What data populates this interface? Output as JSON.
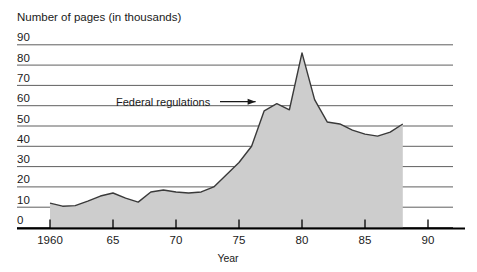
{
  "chart_data": {
    "type": "area",
    "title": "Number of pages (in thousands)",
    "xlabel": "Year",
    "ylabel": "",
    "ylim": [
      0,
      90
    ],
    "xlim": [
      1960,
      1990
    ],
    "grid": true,
    "legend": "none",
    "series_name": "Federal regulations",
    "annotations": [
      {
        "text": "Federal regulations",
        "points_to_x": 1976,
        "points_to_y": 62
      }
    ],
    "y_ticks": [
      "0",
      "10",
      "20",
      "30",
      "40",
      "50",
      "60",
      "70",
      "80",
      "90"
    ],
    "y_tick_values": [
      0,
      10,
      20,
      30,
      40,
      50,
      60,
      70,
      80,
      90
    ],
    "x_ticks": [
      "1960",
      "65",
      "70",
      "75",
      "80",
      "85",
      "90"
    ],
    "x_tick_values": [
      1960,
      1965,
      1970,
      1975,
      1980,
      1985,
      1990
    ],
    "x": [
      1960,
      1961,
      1962,
      1963,
      1964,
      1965,
      1966,
      1967,
      1968,
      1969,
      1970,
      1971,
      1972,
      1973,
      1974,
      1975,
      1976,
      1977,
      1978,
      1979,
      1980,
      1981,
      1982,
      1983,
      1984,
      1985,
      1986,
      1987,
      1988
    ],
    "values": [
      12.0,
      10.5,
      10.8,
      13.0,
      15.5,
      17.0,
      14.5,
      12.5,
      17.5,
      18.5,
      17.5,
      17.0,
      17.5,
      20.0,
      26.0,
      32.0,
      40.0,
      57.5,
      61.0,
      58.0,
      86.0,
      63.0,
      52.0,
      51.0,
      48.0,
      46.0,
      45.0,
      47.0,
      51.0
    ],
    "area_fill_color": "#cdcdcd",
    "line_color": "#3a3a3a",
    "gridline_color": "#4d4d4d",
    "axis_color": "#000000"
  }
}
